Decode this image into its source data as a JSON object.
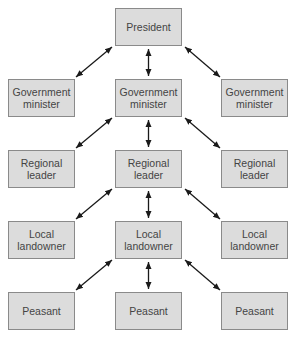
{
  "diagram": {
    "type": "hierarchy",
    "nodes": [
      {
        "id": "president",
        "label": "President",
        "x": 115,
        "y": 8
      },
      {
        "id": "gov_l",
        "label": "Government minister",
        "x": 8,
        "y": 79
      },
      {
        "id": "gov_c",
        "label": "Government minister",
        "x": 115,
        "y": 79
      },
      {
        "id": "gov_r",
        "label": "Government minister",
        "x": 221,
        "y": 79
      },
      {
        "id": "reg_l",
        "label": "Regional leader",
        "x": 8,
        "y": 150
      },
      {
        "id": "reg_c",
        "label": "Regional leader",
        "x": 115,
        "y": 150
      },
      {
        "id": "reg_r",
        "label": "Regional leader",
        "x": 221,
        "y": 150
      },
      {
        "id": "loc_l",
        "label": "Local landowner",
        "x": 8,
        "y": 221
      },
      {
        "id": "loc_c",
        "label": "Local landowner",
        "x": 115,
        "y": 221
      },
      {
        "id": "loc_r",
        "label": "Local landowner",
        "x": 221,
        "y": 221
      },
      {
        "id": "pea_l",
        "label": "Peasant",
        "x": 8,
        "y": 292
      },
      {
        "id": "pea_c",
        "label": "Peasant",
        "x": 115,
        "y": 292
      },
      {
        "id": "pea_r",
        "label": "Peasant",
        "x": 221,
        "y": 292
      }
    ],
    "edges": [
      {
        "from": "president",
        "to": "gov_l",
        "bidirectional": true
      },
      {
        "from": "president",
        "to": "gov_c",
        "bidirectional": true
      },
      {
        "from": "president",
        "to": "gov_r",
        "bidirectional": true
      },
      {
        "from": "gov_c",
        "to": "reg_l",
        "bidirectional": true
      },
      {
        "from": "gov_c",
        "to": "reg_c",
        "bidirectional": true
      },
      {
        "from": "gov_c",
        "to": "reg_r",
        "bidirectional": true
      },
      {
        "from": "reg_c",
        "to": "loc_l",
        "bidirectional": true
      },
      {
        "from": "reg_c",
        "to": "loc_c",
        "bidirectional": true
      },
      {
        "from": "reg_c",
        "to": "loc_r",
        "bidirectional": true
      },
      {
        "from": "loc_c",
        "to": "pea_l",
        "bidirectional": true
      },
      {
        "from": "loc_c",
        "to": "pea_c",
        "bidirectional": true
      },
      {
        "from": "loc_c",
        "to": "pea_r",
        "bidirectional": true
      }
    ],
    "colors": {
      "box_fill": "#dcdcdc",
      "box_border": "#8a8a8a",
      "text": "#444444",
      "arrow": "#1a1a1a"
    }
  }
}
